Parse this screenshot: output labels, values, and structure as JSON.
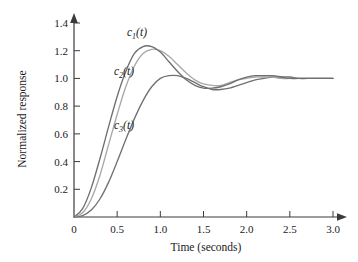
{
  "chart_data": {
    "type": "line",
    "title": "",
    "xlabel": "Time (seconds)",
    "ylabel": "Normalized response",
    "xlim": [
      0,
      3.0
    ],
    "ylim": [
      0,
      1.4
    ],
    "grid": false,
    "legend": "inline-curve-labels",
    "xticks": [
      0,
      0.5,
      1.0,
      1.5,
      2.0,
      2.5,
      3.0
    ],
    "xticklabels": [
      "0",
      "0.5",
      "1.0",
      "1.5",
      "2.0",
      "2.5",
      "3.0"
    ],
    "yticks": [
      0.2,
      0.4,
      0.6,
      0.8,
      1.0,
      1.2,
      1.4
    ],
    "yticklabels": [
      "0.2",
      "0.4",
      "0.6",
      "0.8",
      "1.0",
      "1.2",
      "1.4"
    ],
    "x": [
      0,
      0.1,
      0.2,
      0.3,
      0.4,
      0.5,
      0.6,
      0.7,
      0.8,
      0.9,
      1.0,
      1.1,
      1.2,
      1.3,
      1.4,
      1.5,
      1.6,
      1.7,
      1.8,
      1.9,
      2.0,
      2.1,
      2.2,
      2.3,
      2.4,
      2.5,
      2.6,
      2.7,
      2.8,
      2.9,
      3.0
    ],
    "series": [
      {
        "name": "c1(t)",
        "label": "c_1(t)",
        "color": "#6f6f6f",
        "peak_value": 1.23,
        "peak_time": 0.73,
        "final_value": 1.0,
        "values": [
          0,
          0.06,
          0.21,
          0.42,
          0.65,
          0.87,
          1.05,
          1.18,
          1.23,
          1.23,
          1.19,
          1.12,
          1.05,
          0.99,
          0.95,
          0.93,
          0.93,
          0.94,
          0.96,
          0.99,
          1.01,
          1.02,
          1.02,
          1.02,
          1.01,
          1.0,
          1.0,
          1.0,
          1.0,
          1.0,
          1.0
        ]
      },
      {
        "name": "c2(t)",
        "label": "c_2(t)",
        "color": "#a8a8a8",
        "peak_value": 1.21,
        "peak_time": 0.82,
        "final_value": 1.0,
        "values": [
          0,
          0.03,
          0.13,
          0.3,
          0.52,
          0.74,
          0.94,
          1.09,
          1.18,
          1.21,
          1.2,
          1.16,
          1.1,
          1.04,
          0.99,
          0.96,
          0.95,
          0.95,
          0.97,
          0.99,
          1.0,
          1.01,
          1.01,
          1.01,
          1.0,
          1.0,
          1.0,
          1.0,
          1.0,
          1.0,
          1.0
        ]
      },
      {
        "name": "c3(t)",
        "label": "c_3(t)",
        "color": "#717171",
        "peak_value": 1.02,
        "peak_time": 1.12,
        "final_value": 1.0,
        "values": [
          0,
          0.01,
          0.05,
          0.13,
          0.25,
          0.4,
          0.56,
          0.71,
          0.84,
          0.94,
          1.0,
          1.02,
          1.02,
          1.0,
          0.97,
          0.94,
          0.92,
          0.92,
          0.93,
          0.95,
          0.97,
          0.99,
          1.0,
          1.01,
          1.01,
          1.01,
          1.0,
          1.0,
          1.0,
          1.0,
          1.0
        ]
      }
    ],
    "annotations": [
      {
        "text": "c_1(t)",
        "base": "c",
        "sub": "1",
        "tail": "(t)",
        "x": 0.62,
        "y": 1.33
      },
      {
        "text": "c_2(t)",
        "base": "c",
        "sub": "2",
        "tail": "(t)",
        "x": 0.7,
        "y": 1.06
      },
      {
        "text": "c_3(t)",
        "base": "c",
        "sub": "3",
        "tail": "(t)",
        "x": 0.7,
        "y": 0.66
      }
    ]
  },
  "axes": {
    "x_title": "Time (seconds)",
    "y_title": "Normalized response"
  },
  "colors": {
    "axis": "#3b3b3b",
    "text": "#1a1a1a",
    "background": "#ffffff",
    "curve_1": "#6f6f6f",
    "curve_2": "#a8a8a8",
    "curve_3": "#717171"
  }
}
